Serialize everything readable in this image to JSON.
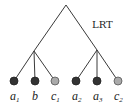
{
  "diagram": {
    "type": "tree",
    "root": {
      "label": "LRT",
      "x": 66,
      "y": 5
    },
    "internal_nodes": [
      {
        "id": "left",
        "x": 34,
        "y": 51
      },
      {
        "id": "right",
        "x": 97,
        "y": 50
      }
    ],
    "leaves": [
      {
        "base": "a",
        "sub": "1",
        "x": 14,
        "y": 81,
        "shade": "dark",
        "parent": "left"
      },
      {
        "base": "b",
        "sub": "",
        "x": 35,
        "y": 81,
        "shade": "dark",
        "parent": "left"
      },
      {
        "base": "c",
        "sub": "1",
        "x": 55,
        "y": 81,
        "shade": "light",
        "parent": "left"
      },
      {
        "base": "a",
        "sub": "2",
        "x": 76,
        "y": 81,
        "shade": "dark",
        "parent": "right"
      },
      {
        "base": "a",
        "sub": "3",
        "x": 97,
        "y": 81,
        "shade": "dark",
        "parent": "right"
      },
      {
        "base": "c",
        "sub": "2",
        "x": 118,
        "y": 81,
        "shade": "light",
        "parent": "right"
      }
    ],
    "colors": {
      "dark": "#333333",
      "light": "#aaaaaa",
      "edge": "#3a3a3a"
    }
  }
}
